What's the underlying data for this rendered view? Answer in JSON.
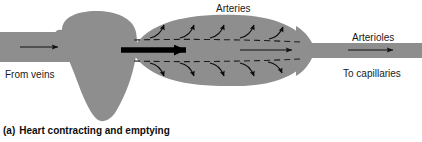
{
  "figure": {
    "caption_letter": "(a)",
    "caption_text": "Heart contracting and emptying",
    "colors": {
      "vessel_fill": "#8e8e8e",
      "background": "#ffffff",
      "stroke": "#1a1a1a",
      "label_text": "#1a1a1a",
      "caption_text": "#0d0d0d"
    }
  },
  "labels": {
    "arteries": "Arteries",
    "arterioles": "Arterioles",
    "from_veins": "From veins",
    "to_capillaries": "To capillaries"
  },
  "diagram": {
    "type": "anatomical-schematic",
    "parts": [
      {
        "name": "vein-tube",
        "label": "From veins"
      },
      {
        "name": "heart-chamber",
        "label": ""
      },
      {
        "name": "artery-bulge",
        "label": "Arteries"
      },
      {
        "name": "arteriole-tube",
        "label": "Arterioles"
      }
    ],
    "flow_arrows": {
      "vein_inflow": "thin-right-arrow",
      "heart_outflow": "thick-right-arrow",
      "artery_flow": "thin-right-arrow",
      "arteriole_flow": "thin-right-arrow",
      "wall_recoil_upper_count": 5,
      "wall_recoil_lower_count": 5
    },
    "dashed_lines": {
      "upper": "artery-upper-dashed-boundary",
      "lower": "artery-lower-dashed-boundary"
    }
  }
}
